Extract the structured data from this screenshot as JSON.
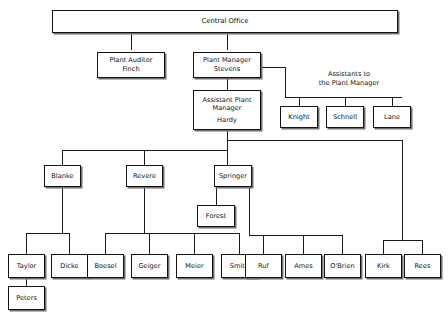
{
  "diagram": {
    "kind": "organization-chart",
    "background_color": "#ffffff",
    "box_fill": "#ffffff",
    "box_border_color": "#141414",
    "shadow_color": "#6e6e6e",
    "line_color": "#1a1a1a"
  },
  "captions": {
    "assistants": {
      "line1": "Assistants to",
      "line2": "the Plant Manager"
    }
  },
  "nodes": {
    "central_office": {
      "title": "Central Office"
    },
    "plant_auditor": {
      "title": "Plant Auditor",
      "name": "Finch"
    },
    "plant_manager": {
      "title": "Plant Manager",
      "name": "Stevens"
    },
    "assistant_plant_manager": {
      "title_line1": "Assistant Plant",
      "title_line2": "Manager",
      "name": "Hardy"
    },
    "knight": {
      "name": "Knight"
    },
    "schnell": {
      "name": "Schnell"
    },
    "lane": {
      "name": "Lane"
    },
    "blanke": {
      "name": "Blanke"
    },
    "revere": {
      "name": "Revere"
    },
    "springer": {
      "name": "Springer"
    },
    "forest": {
      "name": "Forest"
    },
    "taylor": {
      "name": "Taylor"
    },
    "dicke": {
      "name": "Dicke"
    },
    "boesel": {
      "name": "Boesel"
    },
    "geiger": {
      "name": "Geiger"
    },
    "meier": {
      "name": "Meier"
    },
    "smith": {
      "name": "Smith"
    },
    "ruf": {
      "name": "Ruf"
    },
    "ames": {
      "name": "Ames"
    },
    "obrien": {
      "name": "O'Brien"
    },
    "kirk": {
      "name": "Kirk"
    },
    "rees": {
      "name": "Rees"
    },
    "peters": {
      "name": "Peters"
    }
  }
}
